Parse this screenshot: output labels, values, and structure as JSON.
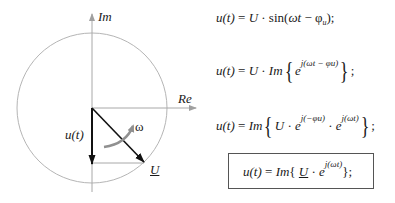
{
  "diagram": {
    "axes": {
      "imaginary_label": "Im",
      "real_label": "Re"
    },
    "phasor_label": "U",
    "projection_label": "u(t)",
    "rotation_label": "ω",
    "colors": {
      "circle": "#b0b0b0",
      "axis": "#a8a8a8",
      "arrow": "#111111",
      "rotation_arrow": "#909090"
    }
  },
  "equations": [
    {
      "lhs": "u(t)",
      "rhs": "U · sin(ωt − φu);"
    },
    {
      "lhs": "u(t)",
      "rhs": "U · Im{ e^{j(ωt − φu)} };"
    },
    {
      "lhs": "u(t)",
      "rhs": "Im{ U · e^{j(−φu)} · e^{j(ωt)} };"
    },
    {
      "lhs": "u(t)",
      "rhs": "Im{ U̲ · e^{j(ωt)} };",
      "boxed": true
    }
  ],
  "eq_parts": {
    "u_t": "u(t)",
    "equals": "=",
    "U": "U",
    "dot": "·",
    "sin": "sin",
    "open_paren": "(",
    "omega_t": "ωt",
    "minus": "−",
    "phi": "φ",
    "phi_sub": "u",
    "close_semi": ");",
    "Im": "Im",
    "e": "e",
    "exp1": "j(ωt − φu)",
    "exp2": "j(−φu)",
    "exp3": "j(ωt)",
    "lbrace": "{",
    "rbrace_semi": "};",
    "semi": ";"
  }
}
